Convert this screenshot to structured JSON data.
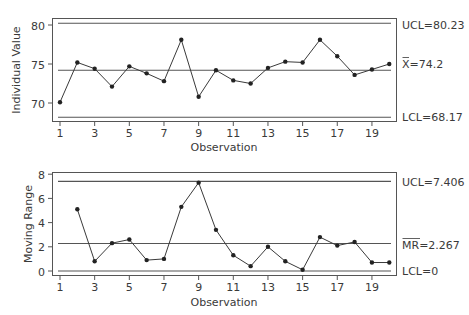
{
  "colors": {
    "line": "#3a3a3a",
    "frame": "#555555",
    "limit": "#555555",
    "background": "#ffffff"
  },
  "chart_data": [
    {
      "type": "line",
      "title": "",
      "xlabel": "Observation",
      "ylabel": "Individual Value",
      "x": [
        1,
        2,
        3,
        4,
        5,
        6,
        7,
        8,
        9,
        10,
        11,
        12,
        13,
        14,
        15,
        16,
        17,
        18,
        19,
        20
      ],
      "values": [
        70.1,
        75.2,
        74.4,
        72.1,
        74.7,
        73.8,
        72.8,
        78.1,
        70.8,
        74.2,
        72.9,
        72.5,
        74.5,
        75.3,
        75.2,
        78.1,
        76.0,
        73.6,
        74.3,
        75.0
      ],
      "xticks": [
        "1",
        "3",
        "5",
        "7",
        "9",
        "11",
        "13",
        "15",
        "17",
        "19"
      ],
      "yticks": [
        "70",
        "75",
        "80"
      ],
      "ylim": [
        67.3,
        80.9
      ],
      "reference_lines": [
        {
          "name": "UCL",
          "value": 80.23,
          "label": "UCL=80.23"
        },
        {
          "name": "Center",
          "value": 74.2,
          "label": "X̄=74.2"
        },
        {
          "name": "LCL",
          "value": 68.17,
          "label": "LCL=68.17"
        }
      ],
      "grid": false,
      "legend": "none"
    },
    {
      "type": "line",
      "title": "",
      "xlabel": "Observation",
      "ylabel": "Moving Range",
      "x": [
        2,
        3,
        4,
        5,
        6,
        7,
        8,
        9,
        10,
        11,
        12,
        13,
        14,
        15,
        16,
        17,
        18,
        19,
        20
      ],
      "values": [
        5.1,
        0.8,
        2.3,
        2.6,
        0.9,
        1.0,
        5.3,
        7.3,
        3.4,
        1.3,
        0.4,
        2.0,
        0.8,
        0.1,
        2.8,
        2.1,
        2.4,
        0.7,
        0.7
      ],
      "xticks": [
        "1",
        "3",
        "5",
        "7",
        "9",
        "11",
        "13",
        "15",
        "17",
        "19"
      ],
      "yticks": [
        "0",
        "2",
        "4",
        "6",
        "8"
      ],
      "ylim": [
        -0.4,
        8.1
      ],
      "reference_lines": [
        {
          "name": "UCL",
          "value": 7.406,
          "label": "UCL=7.406"
        },
        {
          "name": "Center",
          "value": 2.267,
          "label": "MR̄=2.267"
        },
        {
          "name": "LCL",
          "value": 0,
          "label": "LCL=0"
        }
      ],
      "grid": false,
      "legend": "none"
    }
  ],
  "labels": {
    "top_ylabel": "Individual Value",
    "bottom_ylabel": "Moving Range",
    "xlabel": "Observation",
    "top_ucl": "UCL=80.23",
    "top_center_sym": "X",
    "top_center_val": "=74.2",
    "top_lcl": "LCL=68.17",
    "bot_ucl": "UCL=7.406",
    "bot_center_sym": "MR",
    "bot_center_val": "=2.267",
    "bot_lcl": "LCL=0"
  }
}
